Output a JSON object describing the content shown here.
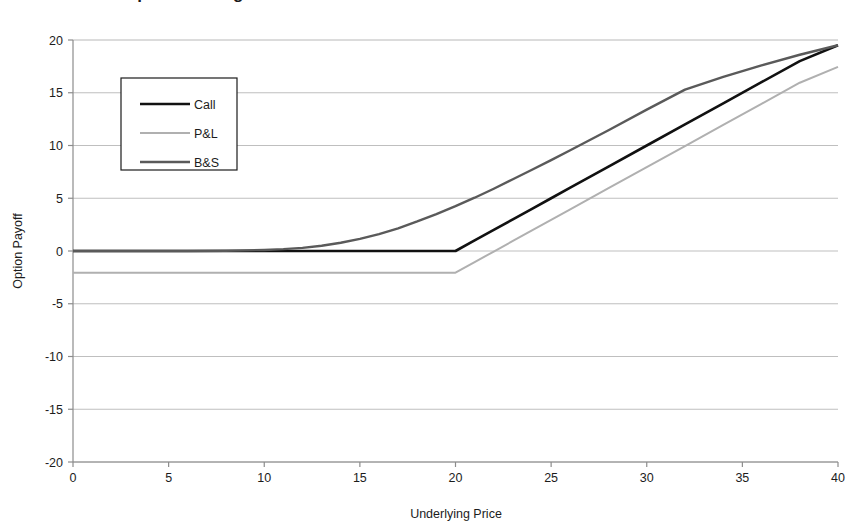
{
  "chart_data": {
    "type": "line",
    "title": "Black-Scholes Option Pricing Model",
    "xlabel": "Underlying Price",
    "ylabel": "Option Payoff",
    "xlim": [
      0,
      40
    ],
    "ylim": [
      -20,
      20
    ],
    "xticks": [
      0,
      5,
      10,
      15,
      20,
      25,
      30,
      35,
      40
    ],
    "yticks": [
      20,
      15,
      10,
      5,
      0,
      -5,
      -10,
      -15,
      -20
    ],
    "xtick_labels": [
      "0",
      "5",
      "10",
      "15",
      "20",
      "25",
      "30",
      "35",
      "40"
    ],
    "ytick_labels": [
      "20",
      "15",
      "10",
      "5",
      "0",
      "-5",
      "-10",
      "-15",
      "-20"
    ],
    "grid": "horizontal",
    "legend_position": "upper-left-inside",
    "strike": 20,
    "premium": 2.05,
    "x": [
      0,
      2,
      4,
      6,
      8,
      10,
      11,
      12,
      13,
      14,
      15,
      16,
      17,
      18,
      19,
      20,
      21,
      22,
      23,
      24,
      25,
      26,
      28,
      30,
      32,
      34,
      36,
      38,
      40
    ],
    "series": [
      {
        "name": "Call",
        "color": "#111111",
        "width": 2.6,
        "values": [
          0,
          0,
          0,
          0,
          0,
          0,
          0,
          0,
          0,
          0,
          0,
          0,
          0,
          0,
          0,
          0,
          1.0,
          2.0,
          3.0,
          4.0,
          5.0,
          6.0,
          8.0,
          10.0,
          12.0,
          14.0,
          16.0,
          18.0,
          19.5
        ]
      },
      {
        "name": "P&L",
        "color": "#b0b0b0",
        "width": 2.0,
        "values": [
          -2.05,
          -2.05,
          -2.05,
          -2.05,
          -2.05,
          -2.05,
          -2.05,
          -2.05,
          -2.05,
          -2.05,
          -2.05,
          -2.05,
          -2.05,
          -2.05,
          -2.05,
          -2.05,
          -1.05,
          -0.05,
          0.95,
          1.95,
          2.95,
          3.95,
          5.95,
          7.95,
          9.95,
          11.95,
          13.95,
          15.95,
          17.45
        ]
      },
      {
        "name": "B&S",
        "color": "#5a5a5a",
        "width": 2.4,
        "values": [
          0.0,
          0.0,
          0.0,
          0.0,
          0.02,
          0.1,
          0.18,
          0.3,
          0.5,
          0.78,
          1.15,
          1.6,
          2.15,
          2.8,
          3.5,
          4.25,
          5.05,
          5.9,
          6.8,
          7.7,
          8.62,
          9.55,
          11.45,
          13.4,
          15.3,
          16.5,
          17.6,
          18.6,
          19.5
        ]
      }
    ],
    "legend": [
      {
        "label": "Call",
        "color": "#111111"
      },
      {
        "label": "P&L",
        "color": "#b0b0b0"
      },
      {
        "label": "B&S",
        "color": "#5a5a5a"
      }
    ],
    "colors": {
      "call": "#111111",
      "pnl": "#b0b0b0",
      "bs": "#5a5a5a",
      "grid": "#b8b8b8",
      "axis": "#8c8c8c",
      "text": "#1c1c1c",
      "background": "#ffffff"
    }
  }
}
